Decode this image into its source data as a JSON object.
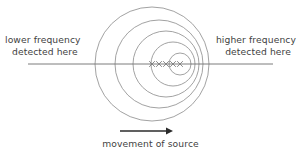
{
  "diagram": {
    "colors": {
      "stroke": "#8a8a8a",
      "axis": "#6e6e6e",
      "text": "#3f3f3f",
      "background": "#ffffff",
      "arrow": "#2b2b2b",
      "marker": "#7a7a7a"
    }
  },
  "labels": {
    "left": {
      "line1": "lower frequency",
      "line2": "detected here"
    },
    "right": {
      "line1": "higher frequency",
      "line2": "detected here"
    },
    "bottom": {
      "line1": "movement of source"
    }
  },
  "axis": {
    "name": "horizontal-detection-line",
    "x1": 28,
    "y1": 64,
    "x2": 273,
    "y2": 64
  },
  "arrow": {
    "name": "movement-arrow",
    "x1": 120,
    "y1": 131,
    "x2": 173,
    "y2": 131,
    "direction": "right"
  },
  "wavefronts": [
    {
      "id": 1,
      "cx": 152,
      "cy": 64,
      "r": 57,
      "label": "outermost-wavefront"
    },
    {
      "id": 2,
      "cx": 159,
      "cy": 64,
      "r": 44,
      "label": "wavefront-2"
    },
    {
      "id": 3,
      "cx": 166,
      "cy": 64,
      "r": 33,
      "label": "wavefront-3"
    },
    {
      "id": 4,
      "cx": 173,
      "cy": 64,
      "r": 22,
      "label": "wavefront-4"
    },
    {
      "id": 5,
      "cx": 180,
      "cy": 64,
      "r": 11,
      "label": "innermost-wavefront"
    }
  ],
  "source_markers": [
    {
      "id": 1,
      "x": 152,
      "y": 64
    },
    {
      "id": 2,
      "x": 159,
      "y": 64
    },
    {
      "id": 3,
      "x": 166,
      "y": 64
    },
    {
      "id": 4,
      "x": 173,
      "y": 64
    },
    {
      "id": 5,
      "x": 180,
      "y": 64
    }
  ]
}
